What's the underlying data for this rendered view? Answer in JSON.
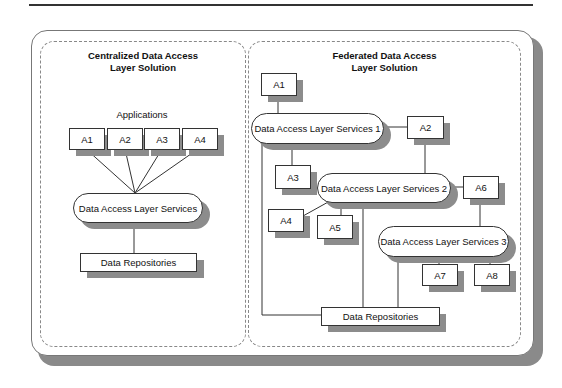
{
  "diagram": {
    "left_panel": {
      "title_line1": "Centralized Data Access",
      "title_line2": "Layer Solution",
      "applications_label": "Applications",
      "apps": [
        "A1",
        "A2",
        "A3",
        "A4"
      ],
      "services": "Data Access Layer Services",
      "repositories": "Data Repositories"
    },
    "right_panel": {
      "title_line1": "Federated Data Access",
      "title_line2": "Layer Solution",
      "apps": [
        "A1",
        "A2",
        "A3",
        "A4",
        "A5",
        "A6",
        "A7",
        "A8"
      ],
      "services": [
        "Data Access Layer Services 1",
        "Data Access Layer Services 2",
        "Data Access Layer Services 3"
      ],
      "repositories": "Data Repositories"
    },
    "colors": {
      "line": "#333333",
      "shadow": "#8c8c8c",
      "dashed": "#888888"
    }
  }
}
